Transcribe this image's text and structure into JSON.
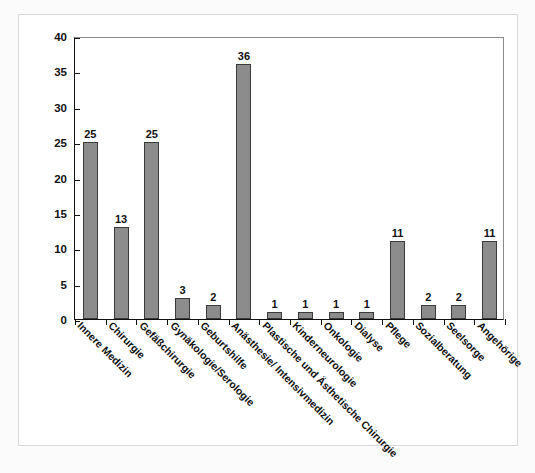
{
  "chart_data": {
    "type": "bar",
    "title": "",
    "subtitle": "",
    "xlabel": "",
    "ylabel": "",
    "ylim": [
      0,
      40
    ],
    "ytick_step": 5,
    "yticks": [
      "0",
      "5",
      "10",
      "15",
      "20",
      "25",
      "30",
      "35",
      "40"
    ],
    "grid": false,
    "legend": null,
    "bar_color": "#8c8c8c",
    "bar_edge_color": "#3a3a3a",
    "axis_color": "#111111",
    "frame_color": "#8a8a8a",
    "panel_background": "#ffffff",
    "outer_background": "#fbfbfb",
    "categories": [
      "Innere Medizin",
      "Chirurgie",
      "Gefäßchirurgie",
      "Gynäkologie/Serologie",
      "Geburtshilfe",
      "Anästhesie/ Intensivmedizin",
      "Plastische und Ästhetische Chirurgie",
      "Kinderneurologie",
      "Onkologie",
      "Dialyse",
      "Pflege",
      "Sozialberatung",
      "Seelsorge",
      "Angehörige"
    ],
    "values": [
      25,
      13,
      25,
      3,
      2,
      36,
      1,
      1,
      1,
      1,
      11,
      2,
      2,
      11
    ],
    "data_labels": [
      "25",
      "13",
      "25",
      "3",
      "2",
      "36",
      "1",
      "1",
      "1",
      "1",
      "11",
      "2",
      "2",
      "11"
    ]
  }
}
